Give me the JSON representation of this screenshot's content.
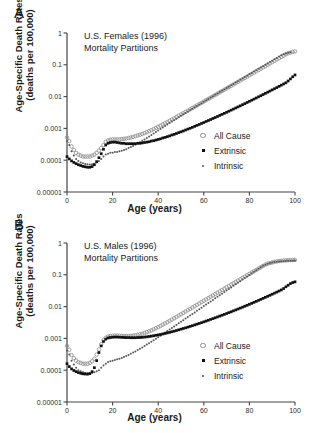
{
  "figure": {
    "panels": [
      {
        "label": "A",
        "title_line1": "U.S. Females (1996)",
        "title_line2": "Mortality Partitions"
      },
      {
        "label": "B",
        "title_line1": "U.S. Males (1996)",
        "title_line2": "Mortality Partitions"
      }
    ],
    "axis": {
      "ylabel_line1": "Age-Specific Death Rates",
      "ylabel_line2": "(deaths per 100,000)",
      "xlabel": "Age (years)",
      "ytick_labels": [
        "1",
        "0.1",
        "0.01",
        "0.001",
        "0.0001",
        "0.00001"
      ],
      "xtick_labels": [
        "0",
        "20",
        "40",
        "60",
        "80",
        "100"
      ]
    },
    "legend": [
      {
        "label": "All Cause",
        "marker": "open-circle",
        "color": "#8c8c8c"
      },
      {
        "label": "Extrinsic",
        "marker": "filled-square",
        "color": "#111111"
      },
      {
        "label": "Intrinsic",
        "marker": "small-dot",
        "color": "#555555"
      }
    ],
    "colors": {
      "all_cause": "#8c8c8c",
      "extrinsic": "#111111",
      "intrinsic": "#555555",
      "axis": "#444444",
      "background": "#ffffff"
    }
  },
  "chart_data": [
    {
      "type": "scatter",
      "title": "U.S. Females (1996) Mortality Partitions",
      "panel": "A",
      "xlabel": "Age (years)",
      "ylabel": "Age-Specific Death Rates (deaths per 100,000)",
      "yscale": "log",
      "ylim": [
        1e-05,
        1
      ],
      "xlim": [
        0,
        100
      ],
      "yticks": [
        1,
        0.1,
        0.01,
        0.001,
        0.0001,
        1e-05
      ],
      "xticks": [
        0,
        20,
        40,
        60,
        80,
        100
      ],
      "grid": false,
      "legend_position": "right-middle",
      "x": [
        0,
        1,
        2,
        3,
        4,
        5,
        6,
        7,
        8,
        9,
        10,
        11,
        12,
        13,
        14,
        15,
        16,
        17,
        18,
        19,
        20,
        21,
        22,
        23,
        24,
        25,
        26,
        27,
        28,
        29,
        30,
        31,
        32,
        33,
        34,
        35,
        36,
        37,
        38,
        39,
        40,
        41,
        42,
        43,
        44,
        45,
        46,
        47,
        48,
        49,
        50,
        51,
        52,
        53,
        54,
        55,
        56,
        57,
        58,
        59,
        60,
        61,
        62,
        63,
        64,
        65,
        66,
        67,
        68,
        69,
        70,
        71,
        72,
        73,
        74,
        75,
        76,
        77,
        78,
        79,
        80,
        81,
        82,
        83,
        84,
        85,
        86,
        87,
        88,
        89,
        90,
        91,
        92,
        93,
        94,
        95,
        96,
        97,
        98,
        99,
        100
      ],
      "series": [
        {
          "name": "All Cause",
          "marker": "open-circle",
          "values": [
            0.00052,
            0.0004,
            0.00027,
            0.00021,
            0.00017,
            0.00015,
            0.00014,
            0.00013,
            0.00013,
            0.00013,
            0.00013,
            0.00014,
            0.00015,
            0.00017,
            0.0002,
            0.00024,
            0.0003,
            0.00038,
            0.00042,
            0.00044,
            0.00045,
            0.00045,
            0.00045,
            0.00045,
            0.00046,
            0.00047,
            0.00048,
            0.0005,
            0.00052,
            0.00054,
            0.00057,
            0.0006,
            0.00063,
            0.00067,
            0.00071,
            0.00076,
            0.00082,
            0.00088,
            0.00095,
            0.00103,
            0.00112,
            0.00122,
            0.00133,
            0.00145,
            0.00158,
            0.00173,
            0.0019,
            0.00208,
            0.00228,
            0.0025,
            0.00274,
            0.003,
            0.0033,
            0.00362,
            0.00398,
            0.00437,
            0.0048,
            0.00527,
            0.0058,
            0.00637,
            0.007,
            0.0077,
            0.00846,
            0.0093,
            0.01022,
            0.01124,
            0.01236,
            0.01359,
            0.01494,
            0.01643,
            0.01807,
            0.01987,
            0.02185,
            0.02403,
            0.02643,
            0.02907,
            0.03198,
            0.03518,
            0.03869,
            0.04256,
            0.04682,
            0.0515,
            0.05665,
            0.06232,
            0.06855,
            0.0754,
            0.08294,
            0.09124,
            0.10036,
            0.1104,
            0.12144,
            0.13358,
            0.14694,
            0.16163,
            0.1778,
            0.19558,
            0.21513,
            0.23065,
            0.242,
            0.253,
            0.264
          ]
        },
        {
          "name": "Intrinsic",
          "marker": "small-dot",
          "values": [
            0.0004,
            0.0003,
            0.00019,
            0.00014,
            0.00011,
            9.5e-05,
            8.5e-05,
            8e-05,
            7.6e-05,
            7.4e-05,
            7.3e-05,
            7.4e-05,
            7.8e-05,
            8.5e-05,
            9.5e-05,
            0.00011,
            0.00013,
            0.00015,
            0.00016,
            0.00017,
            0.00017,
            0.00018,
            0.00018,
            0.00019,
            0.0002,
            0.00021,
            0.00022,
            0.00024,
            0.00026,
            0.00028,
            0.00031,
            0.00034,
            0.00037,
            0.00041,
            0.00045,
            0.0005,
            0.00056,
            0.00062,
            0.00069,
            0.00077,
            0.00086,
            0.00096,
            0.00107,
            0.00119,
            0.00132,
            0.00147,
            0.00164,
            0.00182,
            0.00202,
            0.00225,
            0.0025,
            0.00277,
            0.00307,
            0.0034,
            0.00377,
            0.00417,
            0.00461,
            0.0051,
            0.00564,
            0.00623,
            0.00689,
            0.00761,
            0.00841,
            0.00929,
            0.01026,
            0.01134,
            0.01252,
            0.01383,
            0.01527,
            0.01686,
            0.01862,
            0.02056,
            0.0227,
            0.02507,
            0.02768,
            0.03056,
            0.03374,
            0.03725,
            0.04113,
            0.04541,
            0.05014,
            0.05535,
            0.06111,
            0.06746,
            0.07447,
            0.0822,
            0.09074,
            0.10016,
            0.11056,
            0.12203,
            0.1347,
            0.14869,
            0.16413,
            0.18118,
            0.2,
            0.216,
            0.228,
            0.239,
            0.25
          ]
        },
        {
          "name": "Extrinsic",
          "marker": "filled-square",
          "values": [
            0.00013,
            0.00011,
            9.5e-05,
            8.5e-05,
            7.8e-05,
            7.2e-05,
            6.8e-05,
            6.4e-05,
            6.2e-05,
            6e-05,
            6e-05,
            6.3e-05,
            7.2e-05,
            9e-05,
            0.00012,
            0.00016,
            0.00022,
            0.0003,
            0.00034,
            0.00036,
            0.00037,
            0.00037,
            0.00036,
            0.00035,
            0.00034,
            0.00034,
            0.00033,
            0.00033,
            0.00033,
            0.00033,
            0.00033,
            0.00034,
            0.00034,
            0.00035,
            0.00036,
            0.00037,
            0.00038,
            0.0004,
            0.00041,
            0.00043,
            0.00045,
            0.00047,
            0.0005,
            0.00052,
            0.00055,
            0.00058,
            0.00062,
            0.00065,
            0.00069,
            0.00074,
            0.00078,
            0.00083,
            0.00089,
            0.00095,
            0.00101,
            0.00108,
            0.00116,
            0.00124,
            0.00133,
            0.00143,
            0.00153,
            0.00165,
            0.00177,
            0.0019,
            0.00205,
            0.0022,
            0.00237,
            0.00256,
            0.00276,
            0.00298,
            0.00321,
            0.00347,
            0.00375,
            0.00405,
            0.00438,
            0.00474,
            0.00513,
            0.00556,
            0.00602,
            0.00653,
            0.00708,
            0.00768,
            0.00834,
            0.00905,
            0.00983,
            0.01068,
            0.01161,
            0.01262,
            0.01373,
            0.01493,
            0.01625,
            0.01769,
            0.01926,
            0.02098,
            0.02287,
            0.02494,
            0.02722,
            0.031,
            0.036,
            0.042,
            0.048
          ]
        }
      ]
    },
    {
      "type": "scatter",
      "title": "U.S. Males (1996) Mortality Partitions",
      "panel": "B",
      "xlabel": "Age (years)",
      "ylabel": "Age-Specific Death Rates (deaths per 100,000)",
      "yscale": "log",
      "ylim": [
        1e-05,
        1
      ],
      "xlim": [
        0,
        100
      ],
      "yticks": [
        1,
        0.1,
        0.01,
        0.001,
        0.0001,
        1e-05
      ],
      "xticks": [
        0,
        20,
        40,
        60,
        80,
        100
      ],
      "grid": false,
      "legend_position": "right-middle",
      "x": [
        0,
        1,
        2,
        3,
        4,
        5,
        6,
        7,
        8,
        9,
        10,
        11,
        12,
        13,
        14,
        15,
        16,
        17,
        18,
        19,
        20,
        21,
        22,
        23,
        24,
        25,
        26,
        27,
        28,
        29,
        30,
        31,
        32,
        33,
        34,
        35,
        36,
        37,
        38,
        39,
        40,
        41,
        42,
        43,
        44,
        45,
        46,
        47,
        48,
        49,
        50,
        51,
        52,
        53,
        54,
        55,
        56,
        57,
        58,
        59,
        60,
        61,
        62,
        63,
        64,
        65,
        66,
        67,
        68,
        69,
        70,
        71,
        72,
        73,
        74,
        75,
        76,
        77,
        78,
        79,
        80,
        81,
        82,
        83,
        84,
        85,
        86,
        87,
        88,
        89,
        90,
        91,
        92,
        93,
        94,
        95,
        96,
        97,
        98,
        99,
        100
      ],
      "series": [
        {
          "name": "All Cause",
          "marker": "open-circle",
          "values": [
            0.00058,
            0.00044,
            0.0003,
            0.00024,
            0.0002,
            0.00018,
            0.00017,
            0.00016,
            0.00016,
            0.00016,
            0.00017,
            0.00019,
            0.00023,
            0.00031,
            0.00045,
            0.00065,
            0.00088,
            0.00105,
            0.00115,
            0.00119,
            0.00121,
            0.00122,
            0.00122,
            0.00121,
            0.0012,
            0.00119,
            0.00119,
            0.00119,
            0.0012,
            0.00122,
            0.00125,
            0.00129,
            0.00134,
            0.0014,
            0.00148,
            0.00157,
            0.00167,
            0.00179,
            0.00193,
            0.00209,
            0.00227,
            0.00247,
            0.0027,
            0.00296,
            0.00324,
            0.00356,
            0.00391,
            0.0043,
            0.00473,
            0.00521,
            0.00574,
            0.00633,
            0.00698,
            0.0077,
            0.00849,
            0.00936,
            0.01032,
            0.01138,
            0.01255,
            0.01384,
            0.01526,
            0.01682,
            0.01854,
            0.02044,
            0.02253,
            0.02483,
            0.02737,
            0.03017,
            0.03325,
            0.03665,
            0.04039,
            0.04451,
            0.04905,
            0.05406,
            0.05957,
            0.06564,
            0.07232,
            0.07967,
            0.08776,
            0.09666,
            0.10645,
            0.11722,
            0.12906,
            0.14209,
            0.15641,
            0.17215,
            0.18945,
            0.20846,
            0.223,
            0.235,
            0.245,
            0.255,
            0.263,
            0.27,
            0.276,
            0.281,
            0.285,
            0.288,
            0.29,
            0.292,
            0.294
          ]
        },
        {
          "name": "Intrinsic",
          "marker": "small-dot",
          "values": [
            0.00042,
            0.00031,
            0.0002,
            0.00015,
            0.00012,
            0.0001,
            9.2e-05,
            8.6e-05,
            8.2e-05,
            8e-05,
            8e-05,
            8.2e-05,
            8.6e-05,
            9.3e-05,
            0.0001,
            0.00012,
            0.00014,
            0.00016,
            0.00018,
            0.00019,
            0.0002,
            0.00021,
            0.00022,
            0.00023,
            0.00024,
            0.00026,
            0.00028,
            0.0003,
            0.00033,
            0.00036,
            0.00039,
            0.00043,
            0.00047,
            0.00052,
            0.00058,
            0.00064,
            0.00071,
            0.00079,
            0.00088,
            0.00098,
            0.00109,
            0.00122,
            0.00136,
            0.00152,
            0.0017,
            0.0019,
            0.00213,
            0.00238,
            0.00266,
            0.00298,
            0.00334,
            0.00374,
            0.00419,
            0.00469,
            0.00525,
            0.00588,
            0.00658,
            0.00737,
            0.00825,
            0.00924,
            0.01035,
            0.01159,
            0.01298,
            0.01453,
            0.01627,
            0.01822,
            0.0204,
            0.02284,
            0.02557,
            0.02863,
            0.03205,
            0.03588,
            0.04017,
            0.04497,
            0.05034,
            0.05636,
            0.0631,
            0.07064,
            0.07909,
            0.08854,
            0.09912,
            0.11096,
            0.12422,
            0.13907,
            0.15569,
            0.1743,
            0.192,
            0.208,
            0.222,
            0.234,
            0.244,
            0.252,
            0.259,
            0.264,
            0.268,
            0.271,
            0.273,
            0.275,
            0.277,
            0.279,
            0.281
          ]
        },
        {
          "name": "Extrinsic",
          "marker": "filled-square",
          "values": [
            0.00016,
            0.00013,
            0.00011,
            9.8e-05,
            9e-05,
            8.4e-05,
            8e-05,
            7.7e-05,
            7.6e-05,
            7.5e-05,
            7.8e-05,
            9e-05,
            0.00012,
            0.0002,
            0.00036,
            0.00058,
            0.0008,
            0.00095,
            0.00103,
            0.00107,
            0.00109,
            0.0011,
            0.0011,
            0.00109,
            0.00108,
            0.00107,
            0.00106,
            0.00106,
            0.00105,
            0.00105,
            0.00105,
            0.00106,
            0.00107,
            0.00108,
            0.0011,
            0.00112,
            0.00115,
            0.00118,
            0.00121,
            0.00125,
            0.00129,
            0.00133,
            0.00138,
            0.00143,
            0.00149,
            0.00155,
            0.00162,
            0.00169,
            0.00177,
            0.00186,
            0.00195,
            0.00205,
            0.00215,
            0.00226,
            0.00238,
            0.00251,
            0.00265,
            0.0028,
            0.00296,
            0.00313,
            0.00331,
            0.00351,
            0.00372,
            0.00395,
            0.00419,
            0.00445,
            0.00473,
            0.00503,
            0.00535,
            0.00569,
            0.00606,
            0.00646,
            0.00689,
            0.00735,
            0.00785,
            0.00839,
            0.00897,
            0.0096,
            0.01028,
            0.01101,
            0.0118,
            0.01266,
            0.01359,
            0.0146,
            0.01569,
            0.01687,
            0.01815,
            0.01954,
            0.02105,
            0.02269,
            0.02448,
            0.02643,
            0.02856,
            0.03089,
            0.03345,
            0.037,
            0.042,
            0.047,
            0.053,
            0.057,
            0.06
          ]
        }
      ]
    }
  ]
}
